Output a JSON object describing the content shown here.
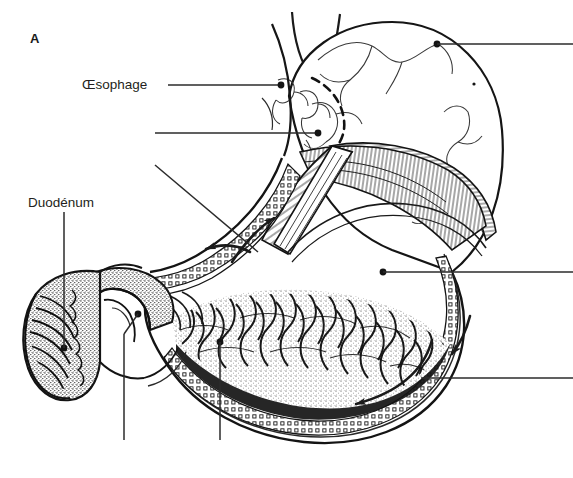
{
  "figure": {
    "panel_letter": "A",
    "background_color": "#ffffff",
    "ink_color": "#231f20",
    "width": 573,
    "height": 478
  },
  "labels": [
    {
      "id": "oesophage",
      "text": "Œsophage",
      "x": 82,
      "y": 78,
      "leader": {
        "from_x": 168,
        "from_y": 85,
        "to_x": 281,
        "to_y": 85,
        "dot": true
      }
    },
    {
      "id": "duodenum",
      "text": "Duodénum",
      "x": 28,
      "y": 196,
      "leader": {
        "from_x": 64,
        "from_y": 212,
        "to_x": 64,
        "to_y": 348,
        "dot": true
      }
    }
  ],
  "unlabeled_leaders": [
    {
      "id": "cardia-leader",
      "note": "horizontal leader to cardia, label cropped at left margin",
      "from_x": 155,
      "from_y": 133,
      "to_x": 318,
      "to_y": 133,
      "dot": true
    },
    {
      "id": "oblique-muscle-leader",
      "note": "diagonal leader to oblique muscle layer, label cropped",
      "from_x": 155,
      "from_y": 165,
      "to_x": 258,
      "to_y": 252,
      "dot": false
    },
    {
      "id": "fundus-leader",
      "note": "leader from fundus running off right edge",
      "from_x": 437,
      "from_y": 44,
      "to_x": 573,
      "to_y": 44,
      "dot": true
    },
    {
      "id": "rugae-leader",
      "note": "leader from gastric rugae running off right edge",
      "from_x": 383,
      "from_y": 272,
      "to_x": 573,
      "to_y": 272,
      "dot": true
    },
    {
      "id": "greater-curvature-leader",
      "note": "leader from greater curvature running off right edge",
      "from_x": 421,
      "from_y": 378,
      "to_x": 573,
      "to_y": 378,
      "dot": false
    },
    {
      "id": "pylorus-leader",
      "note": "leader from pylorus dropping off bottom edge",
      "from_x": 138,
      "from_y": 314,
      "to_x": 124,
      "to_y": 440,
      "dot": true
    },
    {
      "id": "antrum-leader",
      "note": "leader from antral mucosa dropping off bottom edge",
      "from_x": 220,
      "from_y": 342,
      "to_x": 220,
      "to_y": 440,
      "dot": true
    }
  ],
  "flow_arrows": [
    {
      "id": "arrow-lesser-curvature-up",
      "direction": "up-right",
      "x": 272,
      "y": 215
    },
    {
      "id": "arrow-lesser-curvature-left",
      "direction": "left",
      "x": 205,
      "y": 248
    },
    {
      "id": "arrow-greater-curvature-left",
      "direction": "left",
      "x": 352,
      "y": 404
    },
    {
      "id": "arrow-greater-curvature-up",
      "direction": "up-right",
      "x": 455,
      "y": 335
    }
  ],
  "anatomy_parts": [
    {
      "id": "esophagus",
      "name": "Œsophage"
    },
    {
      "id": "cardia",
      "name": "Cardia"
    },
    {
      "id": "fundus",
      "name": "Fundus"
    },
    {
      "id": "body",
      "name": "Corps de l'estomac"
    },
    {
      "id": "rugae",
      "name": "Plis gastriques"
    },
    {
      "id": "muscle-oblique",
      "name": "Couche oblique"
    },
    {
      "id": "muscle-circular",
      "name": "Couche circulaire"
    },
    {
      "id": "muscle-longitudinal",
      "name": "Couche longitudinale"
    },
    {
      "id": "pylorus",
      "name": "Pylore"
    },
    {
      "id": "duodenum",
      "name": "Duodénum"
    }
  ]
}
